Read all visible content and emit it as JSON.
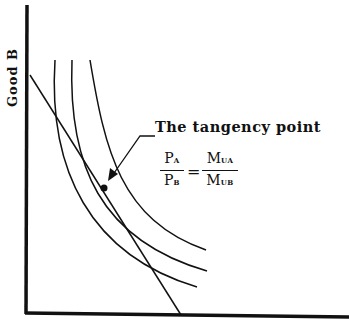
{
  "diagram": {
    "y_axis_label": "Good B",
    "x_axis_label": "",
    "annotation": "The tangency point",
    "equation": {
      "left_num": "P",
      "left_num_sub": "A",
      "left_den": "P",
      "left_den_sub": "B",
      "equals": "=",
      "right_num": "M",
      "right_num_sub": "UA",
      "right_den": "M",
      "right_den_sub": "UB"
    },
    "elements": {
      "indifference_curves": 3,
      "budget_line": "straight line from y-axis to x-axis, tangent to middle curve",
      "tangency_point": "filled dot on middle curve"
    },
    "colors": {
      "line": "#111111",
      "background": "#ffffff"
    }
  }
}
